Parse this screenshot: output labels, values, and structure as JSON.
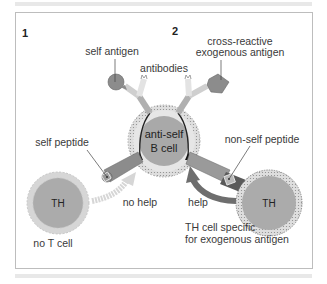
{
  "panels": [
    {
      "number": "1"
    },
    {
      "number": "2"
    }
  ],
  "labels": {
    "self_antigen": "self antigen",
    "cross_reactive_line1": "cross-reactive",
    "cross_reactive_line2": "exogenous antigen",
    "antibodies": "antibodies",
    "self_peptide": "self peptide",
    "non_self_peptide": "non-self peptide",
    "b_cell_line1": "anti-self",
    "b_cell_line2": "B cell",
    "th_left": "TH",
    "th_right": "TH",
    "no_help": "no help",
    "help": "help",
    "no_t_cell": "no T cell",
    "th_specific_line1": "TH cell specific",
    "th_specific_line2": "for exogenous antigen"
  },
  "colors": {
    "cell_fill": "#a9a9a9",
    "cell_rim": "#d9d9d9",
    "dark_arrow": "#6e6e6e",
    "light_arrow": "#d6d6d6",
    "frame_border": "#bdbdbd"
  }
}
